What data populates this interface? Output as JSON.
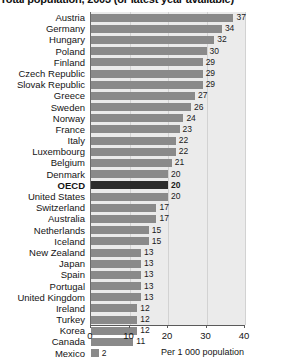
{
  "chart": {
    "title": "Total population, 2003 (or latest year available)",
    "axis_caption": "Per 1 000 population",
    "highlight_label": "OECD"
  },
  "chart_data": {
    "type": "bar",
    "orientation": "horizontal",
    "title": "Total population, 2003 (or latest year available)",
    "xlabel": "Per 1 000 population",
    "ylabel": "",
    "xlim": [
      0,
      40
    ],
    "xticks": [
      0,
      10,
      20,
      30,
      40
    ],
    "grid": true,
    "legend": false,
    "highlight": "OECD",
    "categories": [
      "Austria",
      "Germany",
      "Hungary",
      "Poland",
      "Finland",
      "Czech Republic",
      "Slovak Republic",
      "Greece",
      "Sweden",
      "Norway",
      "France",
      "Italy",
      "Luxembourg",
      "Belgium",
      "Denmark",
      "OECD",
      "United States",
      "Switzerland",
      "Australia",
      "Netherlands",
      "Iceland",
      "New Zealand",
      "Japan",
      "Spain",
      "Portugal",
      "United Kingdom",
      "Ireland",
      "Turkey",
      "Korea",
      "Canada",
      "Mexico"
    ],
    "values": [
      37,
      34,
      32,
      30,
      29,
      29,
      29,
      27,
      26,
      24,
      23,
      22,
      22,
      21,
      20,
      20,
      20,
      17,
      17,
      15,
      15,
      13,
      13,
      13,
      13,
      13,
      12,
      12,
      12,
      11,
      2
    ]
  }
}
